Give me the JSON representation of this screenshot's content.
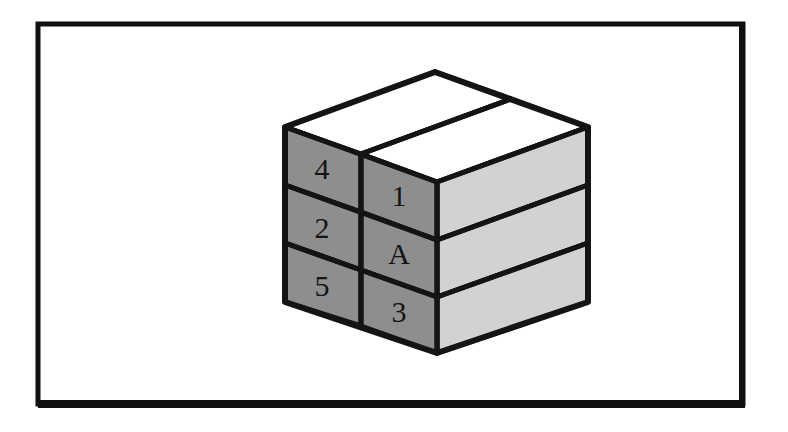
{
  "figure": {
    "background_color": "#ffffff",
    "frame": {
      "name": "figure-border",
      "color": "#111111",
      "x": 38,
      "y": 24,
      "width": 705,
      "height": 384,
      "stroke_top": 5,
      "stroke_bottom": 8
    },
    "colors": {
      "outline": "#141414",
      "top_face": "#ffffff",
      "left_face": "#8e8e8e",
      "right_face": "#d2d2d2",
      "label_text": "#141414"
    },
    "cube": {
      "vertices": {
        "top_apex": [
          435,
          72
        ],
        "top_left": [
          285,
          127
        ],
        "top_right": [
          588,
          127
        ],
        "front_top": [
          437,
          182
        ],
        "front_bottom": [
          437,
          353
        ],
        "bottom_left": [
          285,
          302
        ],
        "bottom_right": [
          588,
          302
        ]
      },
      "layers": 3,
      "left_face": {
        "name": "front-left-face",
        "shade": "dark",
        "columns": 2,
        "rows": 3,
        "cells": [
          {
            "column": "left",
            "row": 1,
            "label": "4"
          },
          {
            "column": "left",
            "row": 2,
            "label": "2"
          },
          {
            "column": "left",
            "row": 3,
            "label": "5"
          },
          {
            "column": "right",
            "row": 1,
            "label": "1"
          },
          {
            "column": "right",
            "row": 2,
            "label": "A"
          },
          {
            "column": "right",
            "row": 3,
            "label": "3"
          }
        ]
      },
      "right_face": {
        "name": "front-right-face",
        "shade": "light",
        "columns": 1,
        "rows": 3,
        "cells": [
          {
            "row": 1,
            "label": ""
          },
          {
            "row": 2,
            "label": ""
          },
          {
            "row": 3,
            "label": ""
          }
        ]
      },
      "top_face": {
        "name": "top-face",
        "shade": "white",
        "panels": 2
      }
    }
  }
}
